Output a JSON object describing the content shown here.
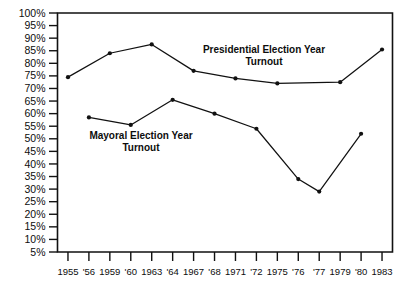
{
  "chart_data": {
    "type": "line",
    "title": "",
    "subtitle": "",
    "xlabel": "",
    "ylabel": "",
    "ylim": [
      5,
      100
    ],
    "ytick_step": 5,
    "grid": false,
    "legend_position": "inline-annotation",
    "y_ticks": [
      "100%",
      "95%",
      "90%",
      "85%",
      "80%",
      "75%",
      "70%",
      "65%",
      "60%",
      "55%",
      "50%",
      "45%",
      "40%",
      "35%",
      "30%",
      "25%",
      "20%",
      "15%",
      "10%",
      "5%"
    ],
    "y_tick_values": [
      100,
      95,
      90,
      85,
      80,
      75,
      70,
      65,
      60,
      55,
      50,
      45,
      40,
      35,
      30,
      25,
      20,
      15,
      10,
      5
    ],
    "x": [
      "1955",
      "'56",
      "1959",
      "'60",
      "1963",
      "'64",
      "1967",
      "'68",
      "1971",
      "'72",
      "1975",
      "'76",
      "'77",
      "1979",
      "'80",
      "1983"
    ],
    "categories": [
      "1955",
      "'56",
      "1959",
      "'60",
      "1963",
      "'64",
      "1967",
      "'68",
      "1971",
      "'72",
      "1975",
      "'76",
      "'77",
      "1979",
      "'80",
      "1983"
    ],
    "series": [
      {
        "name": "Presidential Election Year Turnout",
        "annotation": "Presidential Election Year\nTurnout",
        "annotation_line1": "Presidential Election Year",
        "annotation_line2": "Turnout",
        "color": "#111111",
        "points": [
          {
            "x": "1955",
            "x_index": 0,
            "y": 74.5
          },
          {
            "x": "1959",
            "x_index": 2,
            "y": 84.0
          },
          {
            "x": "1963",
            "x_index": 4,
            "y": 87.5
          },
          {
            "x": "1967",
            "x_index": 6,
            "y": 77.0
          },
          {
            "x": "1971",
            "x_index": 8,
            "y": 74.0
          },
          {
            "x": "1975",
            "x_index": 10,
            "y": 72.0
          },
          {
            "x": "1979",
            "x_index": 13,
            "y": 72.5
          },
          {
            "x": "1983",
            "x_index": 15,
            "y": 85.5
          }
        ]
      },
      {
        "name": "Mayoral Election Year Turnout",
        "annotation": "Mayoral Election Year\nTurnout",
        "annotation_line1": "Mayoral Election Year",
        "annotation_line2": "Turnout",
        "color": "#111111",
        "points": [
          {
            "x": "'56",
            "x_index": 1,
            "y": 58.5
          },
          {
            "x": "'60",
            "x_index": 3,
            "y": 55.5
          },
          {
            "x": "'64",
            "x_index": 5,
            "y": 65.5
          },
          {
            "x": "'68",
            "x_index": 7,
            "y": 60.0
          },
          {
            "x": "'72",
            "x_index": 9,
            "y": 54.0
          },
          {
            "x": "'76",
            "x_index": 11,
            "y": 34.0
          },
          {
            "x": "'77",
            "x_index": 12,
            "y": 29.0
          },
          {
            "x": "'80",
            "x_index": 14,
            "y": 52.0
          }
        ]
      }
    ]
  }
}
